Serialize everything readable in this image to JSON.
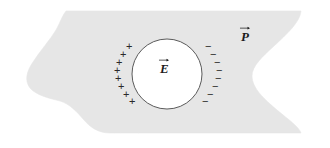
{
  "figure": {
    "background_color": "#ffffff",
    "slab": {
      "name": "dielectric-slab",
      "fill_color": "#e6e6e6",
      "stroke_color": "#e6e6e6",
      "description": "Light gray dielectric block with slanted top-left corner, wavy left edge and concave notch on the right edge"
    },
    "cavity": {
      "name": "spherical-cavity",
      "fill_color": "#ffffff",
      "stroke_color": "#4a4a4a",
      "center_x": 167,
      "center_y": 74,
      "radius": 35
    },
    "field_label": {
      "symbol": "E",
      "accent": "vector-arrow",
      "text": "E"
    },
    "polarization_label": {
      "symbol": "P",
      "accent": "vector-arrow",
      "text": "P"
    },
    "charges": {
      "positive_symbol": "+",
      "negative_symbol": "−",
      "positive_count": 8,
      "negative_count": 8,
      "positive_color": "#2a2a2a",
      "negative_color": "#2a2a2a",
      "positive_positions": [
        {
          "x": 129,
          "y": 46
        },
        {
          "x": 123,
          "y": 54
        },
        {
          "x": 119,
          "y": 62
        },
        {
          "x": 117,
          "y": 70
        },
        {
          "x": 118,
          "y": 78
        },
        {
          "x": 121,
          "y": 86
        },
        {
          "x": 126,
          "y": 94
        },
        {
          "x": 132,
          "y": 101
        }
      ],
      "negative_positions": [
        {
          "x": 207,
          "y": 46
        },
        {
          "x": 212,
          "y": 54
        },
        {
          "x": 216,
          "y": 62
        },
        {
          "x": 218,
          "y": 70
        },
        {
          "x": 217,
          "y": 78
        },
        {
          "x": 214,
          "y": 86
        },
        {
          "x": 209,
          "y": 94
        },
        {
          "x": 204,
          "y": 101
        }
      ]
    }
  }
}
